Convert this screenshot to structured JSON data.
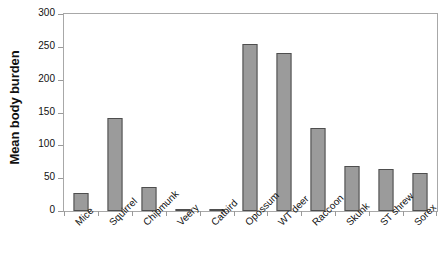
{
  "chart_data": {
    "type": "bar",
    "title": "",
    "xlabel": "",
    "ylabel": "Mean body burden",
    "ylim": [
      0,
      300
    ],
    "yticks": [
      0,
      50,
      100,
      150,
      200,
      250,
      300
    ],
    "grid": false,
    "legend": false,
    "orientation": "vertical",
    "bar_color": "#9b9b9b",
    "bar_edge_color": "#4e4e4e",
    "frame_color": "#a8a8a8",
    "categories": [
      "Mice",
      "Squirrel",
      "Chipmunk",
      "Veery",
      "Catbird",
      "Opossum",
      "WT deer",
      "Raccoon",
      "Skunk",
      "ST shrew",
      "Sorex"
    ],
    "values": [
      28,
      141,
      37,
      2,
      2,
      254,
      240,
      127,
      68,
      64,
      58
    ]
  }
}
